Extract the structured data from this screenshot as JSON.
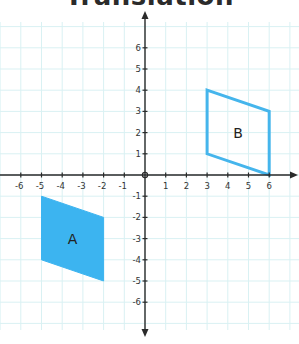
{
  "title": "Translation",
  "colors": {
    "grid": "#d9f1f3",
    "axis": "#2a2a2a",
    "shape_fill": "#3cb4f0",
    "shape_stroke": "#45b5ec"
  },
  "axes": {
    "x_ticks": [
      "-6",
      "-5",
      "-4",
      "-3",
      "-2",
      "-1",
      "1",
      "2",
      "3",
      "4",
      "5",
      "6"
    ],
    "y_ticks": [
      "6",
      "5",
      "4",
      "3",
      "2",
      "1",
      "-1",
      "-2",
      "-3",
      "-4",
      "-5",
      "-6"
    ]
  },
  "shapes": {
    "A": {
      "label": "A",
      "vertices": [
        [
          -5,
          -1
        ],
        [
          -2,
          -2
        ],
        [
          -2,
          -5
        ],
        [
          -5,
          -4
        ]
      ],
      "style": "filled"
    },
    "B": {
      "label": "B",
      "vertices": [
        [
          3,
          4
        ],
        [
          6,
          3
        ],
        [
          6,
          0
        ],
        [
          3,
          1
        ]
      ],
      "style": "outline"
    }
  },
  "chart_data": {
    "type": "scatter",
    "title": "Translation",
    "xlabel": "",
    "ylabel": "",
    "xlim": [
      -7,
      7
    ],
    "ylim": [
      -7,
      7
    ],
    "grid": true,
    "x_ticks": [
      -6,
      -5,
      -4,
      -3,
      -2,
      -1,
      1,
      2,
      3,
      4,
      5,
      6
    ],
    "y_ticks": [
      -6,
      -5,
      -4,
      -3,
      -2,
      -1,
      1,
      2,
      3,
      4,
      5,
      6
    ],
    "series": [
      {
        "name": "A",
        "style": "filled polygon",
        "points": [
          [
            -5,
            -1
          ],
          [
            -2,
            -2
          ],
          [
            -2,
            -5
          ],
          [
            -5,
            -4
          ]
        ]
      },
      {
        "name": "B",
        "style": "outlined polygon",
        "points": [
          [
            3,
            4
          ],
          [
            6,
            3
          ],
          [
            6,
            0
          ],
          [
            3,
            1
          ]
        ]
      }
    ]
  }
}
